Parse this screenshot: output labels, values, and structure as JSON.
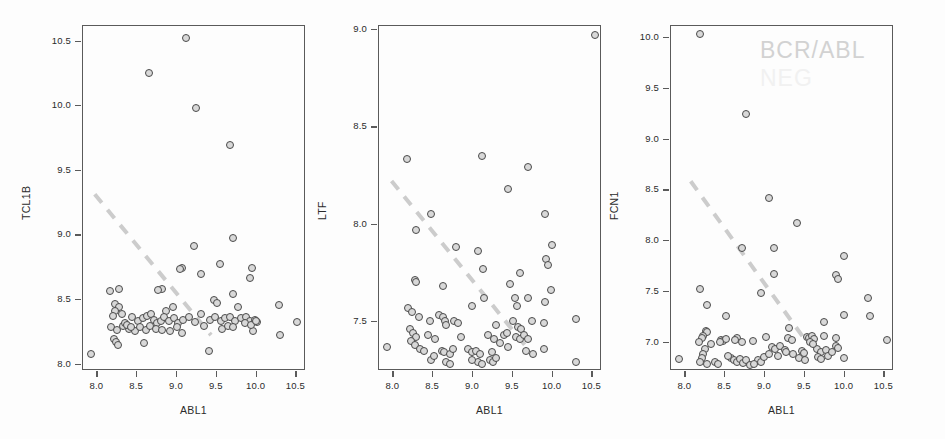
{
  "figure": {
    "xlabel": "ABL1",
    "watermark_line1": "BCR/ABL",
    "watermark_line2": "NEG",
    "marker_fill": "#d8d8d8",
    "marker_stroke": "#4a4a4a",
    "trendline_color": "#cccccc",
    "frame_color": "#5a5a5a"
  },
  "chart_data": [
    {
      "type": "scatter",
      "title": "",
      "xlabel": "ABL1",
      "ylabel": "TCL1B",
      "xlim": [
        7.82,
        10.62
      ],
      "ylim": [
        7.95,
        10.62
      ],
      "xticks": [
        "8.0",
        "8.5",
        "9.0",
        "9.5",
        "10.0",
        "10.5"
      ],
      "xtickvals": [
        8.0,
        8.5,
        9.0,
        9.5,
        10.0,
        10.5
      ],
      "yticks": [
        "8.0",
        "8.5",
        "9.0",
        "9.5",
        "10.0",
        "10.5"
      ],
      "ytickvals": [
        8.0,
        8.5,
        9.0,
        9.5,
        10.0,
        10.5
      ],
      "grid": false,
      "legend": "none",
      "trendline": {
        "x1": 7.98,
        "y1": 9.31,
        "x2": 9.44,
        "y2": 8.22,
        "style": "dashed"
      },
      "points": [
        [
          9.12,
          10.52
        ],
        [
          8.66,
          10.25
        ],
        [
          9.25,
          9.98
        ],
        [
          9.68,
          9.69
        ],
        [
          9.72,
          8.97
        ],
        [
          9.22,
          8.91
        ],
        [
          9.55,
          8.77
        ],
        [
          9.96,
          8.74
        ],
        [
          9.08,
          8.74
        ],
        [
          9.05,
          8.73
        ],
        [
          9.32,
          8.69
        ],
        [
          9.93,
          8.66
        ],
        [
          9.72,
          8.54
        ],
        [
          9.48,
          8.49
        ],
        [
          9.52,
          8.47
        ],
        [
          8.28,
          8.58
        ],
        [
          8.17,
          8.56
        ],
        [
          8.82,
          8.58
        ],
        [
          8.78,
          8.57
        ],
        [
          10.29,
          8.45
        ],
        [
          9.78,
          8.44
        ],
        [
          8.96,
          8.44
        ],
        [
          8.88,
          8.41
        ],
        [
          8.23,
          8.46
        ],
        [
          8.29,
          8.44
        ],
        [
          8.24,
          8.41
        ],
        [
          8.32,
          8.38
        ],
        [
          8.21,
          8.37
        ],
        [
          8.45,
          8.36
        ],
        [
          8.52,
          8.33
        ],
        [
          8.58,
          8.35
        ],
        [
          8.64,
          8.37
        ],
        [
          8.69,
          8.38
        ],
        [
          8.72,
          8.34
        ],
        [
          8.76,
          8.31
        ],
        [
          8.81,
          8.33
        ],
        [
          8.85,
          8.36
        ],
        [
          8.91,
          8.33
        ],
        [
          8.97,
          8.35
        ],
        [
          9.02,
          8.31
        ],
        [
          9.09,
          8.34
        ],
        [
          9.16,
          8.36
        ],
        [
          9.24,
          8.32
        ],
        [
          9.31,
          8.38
        ],
        [
          9.43,
          8.34
        ],
        [
          9.49,
          8.36
        ],
        [
          9.56,
          8.33
        ],
        [
          9.62,
          8.35
        ],
        [
          9.68,
          8.36
        ],
        [
          9.74,
          8.33
        ],
        [
          9.82,
          8.35
        ],
        [
          9.88,
          8.36
        ],
        [
          9.93,
          8.33
        ],
        [
          9.99,
          8.34
        ],
        [
          10.02,
          8.32
        ],
        [
          10.52,
          8.32
        ],
        [
          8.19,
          8.28
        ],
        [
          8.26,
          8.26
        ],
        [
          8.33,
          8.29
        ],
        [
          8.41,
          8.27
        ],
        [
          8.48,
          8.25
        ],
        [
          8.55,
          8.28
        ],
        [
          8.62,
          8.26
        ],
        [
          8.68,
          8.29
        ],
        [
          8.75,
          8.27
        ],
        [
          8.83,
          8.26
        ],
        [
          8.92,
          8.25
        ],
        [
          9.01,
          8.28
        ],
        [
          9.07,
          8.24
        ],
        [
          9.35,
          8.29
        ],
        [
          9.58,
          8.27
        ],
        [
          9.65,
          8.29
        ],
        [
          9.71,
          8.28
        ],
        [
          9.97,
          8.25
        ],
        [
          8.22,
          8.19
        ],
        [
          8.25,
          8.17
        ],
        [
          8.27,
          8.14
        ],
        [
          8.6,
          8.16
        ],
        [
          10.3,
          8.22
        ],
        [
          9.42,
          8.1
        ],
        [
          7.93,
          8.07
        ],
        [
          8.36,
          8.31
        ],
        [
          8.39,
          8.3
        ],
        [
          8.44,
          8.28
        ],
        [
          9.87,
          8.31
        ],
        [
          9.94,
          8.3
        ],
        [
          10.0,
          8.33
        ]
      ]
    },
    {
      "type": "scatter",
      "title": "",
      "xlabel": "ABL1",
      "ylabel": "LTF",
      "xlim": [
        7.82,
        10.62
      ],
      "ylim": [
        7.25,
        9.02
      ],
      "xticks": [
        "8.0",
        "8.5",
        "9.0",
        "9.5",
        "10.0",
        "10.5"
      ],
      "xtickvals": [
        8.0,
        8.5,
        9.0,
        9.5,
        10.0,
        10.5
      ],
      "yticks": [
        "7.5",
        "8.0",
        "8.5",
        "9.0"
      ],
      "ytickvals": [
        7.5,
        8.0,
        8.5,
        9.0
      ],
      "grid": false,
      "legend": "none",
      "trendline": {
        "x1": 7.99,
        "y1": 8.22,
        "x2": 9.72,
        "y2": 7.35,
        "style": "dashed"
      },
      "points": [
        [
          10.55,
          8.97
        ],
        [
          9.12,
          8.35
        ],
        [
          8.19,
          8.33
        ],
        [
          9.7,
          8.29
        ],
        [
          9.45,
          8.18
        ],
        [
          8.48,
          8.05
        ],
        [
          9.92,
          8.05
        ],
        [
          8.3,
          7.97
        ],
        [
          10.0,
          7.89
        ],
        [
          8.8,
          7.88
        ],
        [
          9.08,
          7.86
        ],
        [
          9.93,
          7.82
        ],
        [
          9.95,
          7.79
        ],
        [
          9.14,
          7.77
        ],
        [
          9.6,
          7.75
        ],
        [
          8.28,
          7.71
        ],
        [
          8.3,
          7.7
        ],
        [
          9.48,
          7.69
        ],
        [
          8.63,
          7.68
        ],
        [
          9.99,
          7.66
        ],
        [
          9.54,
          7.62
        ],
        [
          9.7,
          7.62
        ],
        [
          9.15,
          7.62
        ],
        [
          9.92,
          7.6
        ],
        [
          9.0,
          7.58
        ],
        [
          8.2,
          7.57
        ],
        [
          8.25,
          7.55
        ],
        [
          9.56,
          7.58
        ],
        [
          10.3,
          7.51
        ],
        [
          8.33,
          7.52
        ],
        [
          8.47,
          7.5
        ],
        [
          8.59,
          7.53
        ],
        [
          8.63,
          7.52
        ],
        [
          8.66,
          7.5
        ],
        [
          8.68,
          7.48
        ],
        [
          8.78,
          7.5
        ],
        [
          8.82,
          7.49
        ],
        [
          9.3,
          7.48
        ],
        [
          9.52,
          7.5
        ],
        [
          9.58,
          7.47
        ],
        [
          9.62,
          7.46
        ],
        [
          9.75,
          7.5
        ],
        [
          9.9,
          7.49
        ],
        [
          8.22,
          7.46
        ],
        [
          8.26,
          7.44
        ],
        [
          8.3,
          7.42
        ],
        [
          8.24,
          7.4
        ],
        [
          8.28,
          7.38
        ],
        [
          8.45,
          7.43
        ],
        [
          8.54,
          7.41
        ],
        [
          9.2,
          7.43
        ],
        [
          9.28,
          7.41
        ],
        [
          9.4,
          7.43
        ],
        [
          9.55,
          7.42
        ],
        [
          9.6,
          7.41
        ],
        [
          9.65,
          7.43
        ],
        [
          9.7,
          7.41
        ],
        [
          9.35,
          7.39
        ],
        [
          8.35,
          7.36
        ],
        [
          8.4,
          7.35
        ],
        [
          7.93,
          7.37
        ],
        [
          8.62,
          7.35
        ],
        [
          8.65,
          7.34
        ],
        [
          8.72,
          7.33
        ],
        [
          8.76,
          7.36
        ],
        [
          8.95,
          7.36
        ],
        [
          9.0,
          7.34
        ],
        [
          9.05,
          7.35
        ],
        [
          9.1,
          7.33
        ],
        [
          9.25,
          7.34
        ],
        [
          9.45,
          7.37
        ],
        [
          9.68,
          7.35
        ],
        [
          9.76,
          7.33
        ],
        [
          9.9,
          7.36
        ],
        [
          8.48,
          7.3
        ],
        [
          8.68,
          7.29
        ],
        [
          8.72,
          7.28
        ],
        [
          9.08,
          7.29
        ],
        [
          9.12,
          7.28
        ],
        [
          9.22,
          7.3
        ],
        [
          9.26,
          7.29
        ],
        [
          9.3,
          7.31
        ],
        [
          10.3,
          7.29
        ],
        [
          8.52,
          7.32
        ],
        [
          9.0,
          7.3
        ],
        [
          8.86,
          7.42
        ],
        [
          9.44,
          7.44
        ]
      ]
    },
    {
      "type": "scatter",
      "title": "",
      "xlabel": "ABL1",
      "ylabel": "FCN1",
      "xlim": [
        7.82,
        10.62
      ],
      "ylim": [
        6.72,
        10.12
      ],
      "xticks": [
        "8.0",
        "8.5",
        "9.0",
        "9.5",
        "10.0",
        "10.5"
      ],
      "xtickvals": [
        8.0,
        8.5,
        9.0,
        9.5,
        10.0,
        10.5
      ],
      "yticks": [
        "7.0",
        "7.5",
        "8.0",
        "8.5",
        "9.0",
        "9.5",
        "10.0"
      ],
      "ytickvals": [
        7.0,
        7.5,
        8.0,
        8.5,
        9.0,
        9.5,
        10.0
      ],
      "grid": false,
      "legend": "none",
      "trendline": {
        "x1": 8.08,
        "y1": 8.58,
        "x2": 9.55,
        "y2": 6.98,
        "style": "dashed"
      },
      "points": [
        [
          8.2,
          10.03
        ],
        [
          8.78,
          9.24
        ],
        [
          9.06,
          8.42
        ],
        [
          9.42,
          8.17
        ],
        [
          9.12,
          7.92
        ],
        [
          8.73,
          7.92
        ],
        [
          10.0,
          7.84
        ],
        [
          9.13,
          7.67
        ],
        [
          9.9,
          7.66
        ],
        [
          9.93,
          7.62
        ],
        [
          10.3,
          7.43
        ],
        [
          8.2,
          7.52
        ],
        [
          8.96,
          7.48
        ],
        [
          8.29,
          7.36
        ],
        [
          10.0,
          7.26
        ],
        [
          10.33,
          7.25
        ],
        [
          8.52,
          7.25
        ],
        [
          9.75,
          7.19
        ],
        [
          9.32,
          7.13
        ],
        [
          8.27,
          7.1
        ],
        [
          8.29,
          7.09
        ],
        [
          8.24,
          7.06
        ],
        [
          8.22,
          7.04
        ],
        [
          8.46,
          7.02
        ],
        [
          8.49,
          7.01
        ],
        [
          8.52,
          7.03
        ],
        [
          8.66,
          7.04
        ],
        [
          8.72,
          7.0
        ],
        [
          9.02,
          7.05
        ],
        [
          9.3,
          7.04
        ],
        [
          9.35,
          7.02
        ],
        [
          9.54,
          7.05
        ],
        [
          9.57,
          7.04
        ],
        [
          9.6,
          7.06
        ],
        [
          9.63,
          7.03
        ],
        [
          9.75,
          7.06
        ],
        [
          9.9,
          7.04
        ],
        [
          10.55,
          7.02
        ],
        [
          8.18,
          7.0
        ],
        [
          8.33,
          6.98
        ],
        [
          8.45,
          7.0
        ],
        [
          8.63,
          7.02
        ],
        [
          8.86,
          7.01
        ],
        [
          9.1,
          6.95
        ],
        [
          9.14,
          6.93
        ],
        [
          9.2,
          6.96
        ],
        [
          9.26,
          6.92
        ],
        [
          9.48,
          6.91
        ],
        [
          9.5,
          6.89
        ],
        [
          9.66,
          6.93
        ],
        [
          9.72,
          6.9
        ],
        [
          9.78,
          6.92
        ],
        [
          9.9,
          6.96
        ],
        [
          9.93,
          6.94
        ],
        [
          10.0,
          6.84
        ],
        [
          7.93,
          6.83
        ],
        [
          8.26,
          6.93
        ],
        [
          8.24,
          6.88
        ],
        [
          8.22,
          6.84
        ],
        [
          8.2,
          6.8
        ],
        [
          8.28,
          6.78
        ],
        [
          8.58,
          6.84
        ],
        [
          8.62,
          6.82
        ],
        [
          8.66,
          6.8
        ],
        [
          8.7,
          6.83
        ],
        [
          8.74,
          6.79
        ],
        [
          8.78,
          6.82
        ],
        [
          8.83,
          6.77
        ],
        [
          8.92,
          6.82
        ],
        [
          8.96,
          6.8
        ],
        [
          9.0,
          6.85
        ],
        [
          9.06,
          6.88
        ],
        [
          9.18,
          6.86
        ],
        [
          9.44,
          6.84
        ],
        [
          9.52,
          6.82
        ],
        [
          9.68,
          6.85
        ],
        [
          9.72,
          6.83
        ],
        [
          9.8,
          6.86
        ],
        [
          8.88,
          6.78
        ],
        [
          8.55,
          6.86
        ],
        [
          9.28,
          6.9
        ],
        [
          9.36,
          6.88
        ],
        [
          9.58,
          7.0
        ],
        [
          9.62,
          6.98
        ],
        [
          8.38,
          6.8
        ],
        [
          8.42,
          6.78
        ],
        [
          9.86,
          6.9
        ]
      ]
    }
  ]
}
